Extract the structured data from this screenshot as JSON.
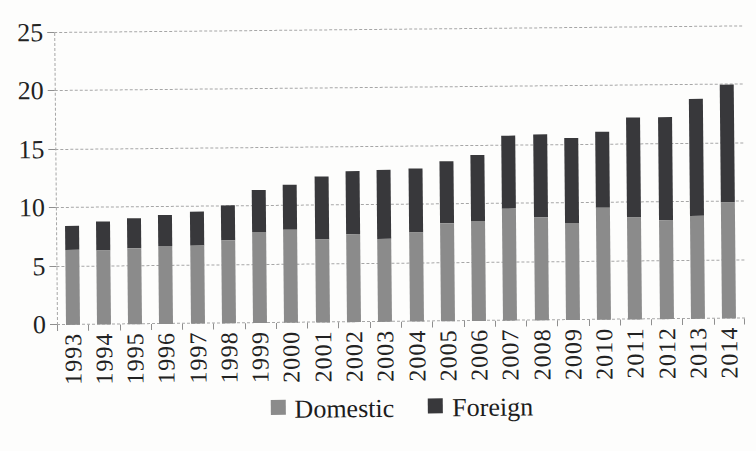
{
  "chart_data": {
    "type": "bar",
    "stacked": true,
    "title": "",
    "xlabel": "",
    "ylabel": "",
    "ylim": [
      0,
      25
    ],
    "yticks": [
      0,
      5,
      10,
      15,
      20,
      25
    ],
    "grid": "dashed-horizontal",
    "legend_position": "bottom-center",
    "categories": [
      "1993",
      "1994",
      "1995",
      "1996",
      "1997",
      "1998",
      "1999",
      "2000",
      "2001",
      "2002",
      "2003",
      "2004",
      "2005",
      "2006",
      "2007",
      "2008",
      "2009",
      "2010",
      "2011",
      "2012",
      "2013",
      "2014"
    ],
    "series": [
      {
        "name": "Domestic",
        "color": "#8b8b8b",
        "values": [
          6.4,
          6.3,
          6.5,
          6.7,
          6.7,
          7.1,
          7.8,
          8.0,
          7.1,
          7.5,
          7.1,
          7.6,
          8.4,
          8.6,
          9.6,
          8.8,
          8.3,
          9.6,
          8.7,
          8.5,
          8.8,
          9.9
        ]
      },
      {
        "name": "Foreign",
        "color": "#38383b",
        "values": [
          2.1,
          2.5,
          2.6,
          2.6,
          2.9,
          3.0,
          3.6,
          3.8,
          5.4,
          5.4,
          5.9,
          5.5,
          5.3,
          5.6,
          6.2,
          7.1,
          7.3,
          6.5,
          8.6,
          8.8,
          10.0,
          10.1
        ]
      }
    ],
    "totals": [
      8.5,
      8.8,
      9.1,
      9.3,
      9.6,
      10.1,
      11.4,
      11.8,
      12.5,
      12.9,
      13.0,
      13.1,
      13.7,
      14.2,
      15.8,
      15.9,
      15.6,
      16.1,
      17.3,
      17.3,
      18.8,
      20.0
    ]
  },
  "legend": {
    "items": [
      {
        "label": "Domestic",
        "color": "#8b8b8b"
      },
      {
        "label": "Foreign",
        "color": "#38383b"
      }
    ]
  },
  "colors": {
    "background": "#fdfdfc",
    "gridline": "#a6a6a6",
    "axis_text": "#222222"
  }
}
